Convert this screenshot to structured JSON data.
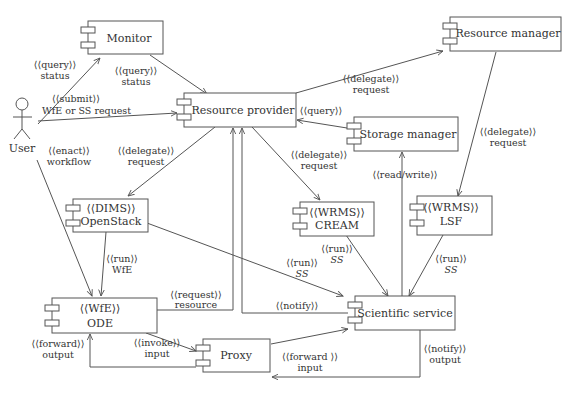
{
  "diagram": {
    "type": "UML component diagram",
    "actor": {
      "name": "User"
    },
    "components": [
      {
        "id": "monitor",
        "stereotype": "",
        "name": "Monitor"
      },
      {
        "id": "resource-provider",
        "stereotype": "",
        "name": "Resource provider"
      },
      {
        "id": "resource-manager",
        "stereotype": "",
        "name": "Resource manager"
      },
      {
        "id": "storage-manager",
        "stereotype": "",
        "name": "Storage manager"
      },
      {
        "id": "openstack",
        "stereotype": "⟨⟨DIMS⟩⟩",
        "name": "OpenStack"
      },
      {
        "id": "cream",
        "stereotype": "⟨⟨WRMS⟩⟩",
        "name": "CREAM"
      },
      {
        "id": "lsf",
        "stereotype": "⟨⟨WRMS⟩⟩",
        "name": "LSF"
      },
      {
        "id": "ode",
        "stereotype": "⟨⟨WfE⟩⟩",
        "name": "ODE"
      },
      {
        "id": "scientific-service",
        "stereotype": "",
        "name": "Scientific service"
      },
      {
        "id": "proxy",
        "stereotype": "",
        "name": "Proxy"
      }
    ],
    "edges": [
      {
        "from": "User",
        "to": "Monitor",
        "stereotype": "⟨⟨query⟩⟩",
        "label": "status"
      },
      {
        "from": "Monitor",
        "to": "Resource provider",
        "stereotype": "⟨⟨query⟩⟩",
        "label": "status"
      },
      {
        "from": "User",
        "to": "Resource provider",
        "stereotype": "⟨⟨submit⟩⟩",
        "label": "WfE or SS request"
      },
      {
        "from": "Resource provider",
        "to": "Resource manager",
        "stereotype": "⟨⟨delegate⟩⟩",
        "label": "request"
      },
      {
        "from": "Storage manager",
        "to": "Resource provider",
        "stereotype": "⟨⟨query⟩⟩",
        "label": ""
      },
      {
        "from": "Resource manager",
        "to": "LSF",
        "stereotype": "⟨⟨delegate⟩⟩",
        "label": "request"
      },
      {
        "from": "User",
        "to": "ODE",
        "stereotype": "⟨⟨enact⟩⟩",
        "label": "workflow"
      },
      {
        "from": "Resource provider",
        "to": "OpenStack",
        "stereotype": "⟨⟨delegate⟩⟩",
        "label": "request"
      },
      {
        "from": "Resource provider",
        "to": "CREAM",
        "stereotype": "⟨⟨delegate⟩⟩",
        "label": "request"
      },
      {
        "from": "Scientific service",
        "to": "Storage manager",
        "stereotype": "⟨⟨read/write⟩⟩",
        "label": ""
      },
      {
        "from": "OpenStack",
        "to": "ODE",
        "stereotype": "⟨⟨run⟩⟩",
        "label": "WfE"
      },
      {
        "from": "OpenStack",
        "to": "Scientific service",
        "stereotype": "⟨⟨run⟩⟩",
        "label": "SS"
      },
      {
        "from": "CREAM",
        "to": "Scientific service",
        "stereotype": "⟨⟨run⟩⟩",
        "label": "SS"
      },
      {
        "from": "LSF",
        "to": "Scientific service",
        "stereotype": "⟨⟨run⟩⟩",
        "label": "SS"
      },
      {
        "from": "ODE",
        "to": "Resource provider",
        "stereotype": "⟨⟨request⟩⟩",
        "label": "resource"
      },
      {
        "from": "Scientific service",
        "to": "Resource provider",
        "stereotype": "⟨⟨notify⟩⟩",
        "label": ""
      },
      {
        "from": "Proxy",
        "to": "ODE",
        "stereotype": "⟨⟨forward⟩⟩",
        "label": "output"
      },
      {
        "from": "ODE",
        "to": "Proxy",
        "stereotype": "⟨⟨invoke⟩⟩",
        "label": "input"
      },
      {
        "from": "Proxy",
        "to": "Scientific service",
        "stereotype": "⟨⟨forward ⟩⟩",
        "label": "input"
      },
      {
        "from": "Scientific service",
        "to": "Proxy",
        "stereotype": "⟨⟨notify⟩⟩",
        "label": "output"
      }
    ]
  },
  "labels": {
    "user": "User",
    "monitor": "Monitor",
    "resource_provider": "Resource provider",
    "resource_manager": "Resource manager",
    "storage_manager": "Storage manager",
    "openstack_st": "⟨⟨DIMS⟩⟩",
    "openstack": "OpenStack",
    "cream_st": "⟨⟨WRMS⟩⟩",
    "cream": "CREAM",
    "lsf_st": "⟨⟨WRMS⟩⟩",
    "lsf": "LSF",
    "ode_st": "⟨⟨WfE⟩⟩",
    "ode": "ODE",
    "scientific_service": "Scientific service",
    "proxy": "Proxy",
    "e_user_monitor_st": "⟨⟨query⟩⟩",
    "e_user_monitor": "status",
    "e_monitor_rp_st": "⟨⟨query⟩⟩",
    "e_monitor_rp": "status",
    "e_submit_st": "⟨⟨submit⟩⟩",
    "e_submit": "WfE or SS request",
    "e_rp_rm_st": "⟨⟨delegate⟩⟩",
    "e_rp_rm": "request",
    "e_sm_rp_st": "⟨⟨query⟩⟩",
    "e_rm_lsf_st": "⟨⟨delegate⟩⟩",
    "e_rm_lsf": "request",
    "e_enact_st": "⟨⟨enact⟩⟩",
    "e_enact": "workflow",
    "e_rp_os_st": "⟨⟨delegate⟩⟩",
    "e_rp_os": "request",
    "e_rp_cream_st": "⟨⟨delegate⟩⟩",
    "e_rp_cream": "request",
    "e_rw_st": "⟨⟨read/write⟩⟩",
    "e_os_ode_st": "⟨⟨run⟩⟩",
    "e_os_ode": "WfE",
    "e_os_ss_st": "⟨⟨run⟩⟩",
    "e_os_ss": "SS",
    "e_cream_ss_st": "⟨⟨run⟩⟩",
    "e_cream_ss": "SS",
    "e_lsf_ss_st": "⟨⟨run⟩⟩",
    "e_lsf_ss": "SS",
    "e_req_st": "⟨⟨request⟩⟩",
    "e_req": "resource",
    "e_notify_st": "⟨⟨notify⟩⟩",
    "e_fwd_out_st": "⟨⟨forward⟩⟩",
    "e_fwd_out": "output",
    "e_invoke_st": "⟨⟨invoke⟩⟩",
    "e_invoke": "input",
    "e_fwd_in_st": "⟨⟨forward ⟩⟩",
    "e_fwd_in": "input",
    "e_notify_out_st": "⟨⟨notify⟩⟩",
    "e_notify_out": "output"
  },
  "colors": {
    "stroke": "#555555",
    "text": "#333333",
    "background": "#ffffff"
  }
}
